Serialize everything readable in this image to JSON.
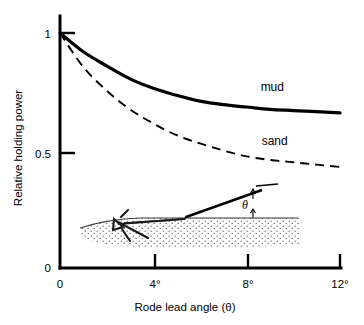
{
  "chart_data": {
    "type": "line",
    "title": "",
    "xlabel": "Rode lead angle (θ)",
    "ylabel": "Relative holding power",
    "xlim": [
      0,
      12
    ],
    "ylim": [
      0,
      1
    ],
    "grid": false,
    "legend_position": "inline-right",
    "x_ticks": [
      {
        "value": 0,
        "label": "0"
      },
      {
        "value": 4,
        "label": "4°"
      },
      {
        "value": 8,
        "label": "8°"
      },
      {
        "value": 12,
        "label": "12°"
      }
    ],
    "y_ticks": [
      {
        "value": 0,
        "label": "0"
      },
      {
        "value": 0.5,
        "label": "0.5"
      },
      {
        "value": 1,
        "label": "1"
      }
    ],
    "x": [
      0,
      1,
      2,
      3,
      4,
      5,
      6,
      7,
      8,
      9,
      10,
      11,
      12
    ],
    "series": [
      {
        "name": "mud",
        "style": "solid",
        "values": [
          1.0,
          0.92,
          0.86,
          0.805,
          0.765,
          0.735,
          0.71,
          0.695,
          0.685,
          0.675,
          0.67,
          0.665,
          0.66
        ]
      },
      {
        "name": "sand",
        "style": "dashed",
        "values": [
          1.0,
          0.855,
          0.755,
          0.675,
          0.615,
          0.565,
          0.53,
          0.5,
          0.475,
          0.46,
          0.45,
          0.44,
          0.43
        ]
      }
    ],
    "annotations": [
      {
        "name": "mud-label",
        "text": "mud",
        "x": 9.1,
        "y": 0.755
      },
      {
        "name": "sand-label",
        "text": "sand",
        "x": 9.2,
        "y": 0.525
      }
    ]
  },
  "inset": {
    "name": "anchor-rode-diagram",
    "angle_symbol": "θ",
    "description": "anchor set in seabed with rode rising at lead angle theta"
  }
}
